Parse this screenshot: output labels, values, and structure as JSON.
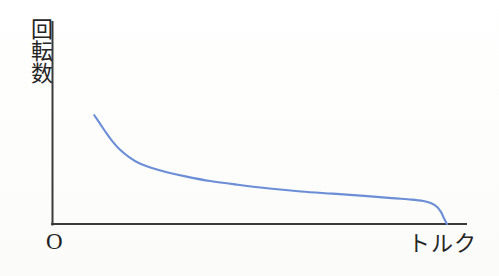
{
  "figure": {
    "background_color": "#fdfdfc",
    "axis_color": "#3a3a3a",
    "curve_color": "#6b8ed6",
    "text_color": "#252525",
    "origin_label": "O",
    "y_axis_label": "回転数",
    "x_axis_label": "トルク"
  },
  "chart_data": {
    "type": "line",
    "title": "",
    "subtitle": "",
    "xlabel": "トルク",
    "ylabel": "回転数",
    "xlim": [
      0,
      100
    ],
    "ylim": [
      0,
      100
    ],
    "grid": false,
    "legend": null,
    "axis_ticks": {
      "x": [],
      "y": []
    },
    "annotations": [
      {
        "text": "O",
        "x": 0,
        "y": 0,
        "role": "origin-marker"
      }
    ],
    "series": [
      {
        "name": "torque-speed characteristic",
        "color": "#6b8ed6",
        "x": [
          10.6,
          12.0,
          13.5,
          15.0,
          17.0,
          19.5,
          22.0,
          25.0,
          29.0,
          34.0,
          40.0,
          47.0,
          55.0,
          63.0,
          71.0,
          79.0,
          86.0,
          91.0,
          94.0,
          96.0,
          97.5,
          98.5,
          99.2,
          100.0
        ],
        "y": [
          73.5,
          68.0,
          62.0,
          56.5,
          50.5,
          45.0,
          41.0,
          38.0,
          35.0,
          32.0,
          29.0,
          26.5,
          24.0,
          22.0,
          20.5,
          19.0,
          17.5,
          16.5,
          15.5,
          14.0,
          11.5,
          8.0,
          4.0,
          0.0
        ]
      }
    ]
  }
}
